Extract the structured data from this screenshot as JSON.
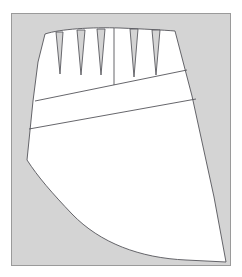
{
  "figure": {
    "title": "Skirt pattern draft with waist darts and yoke lines",
    "kind": "technical-line-drawing",
    "panel": {
      "name": "drawing-panel",
      "background_color": "#d4d4d4",
      "border_color": "#9a9a9a",
      "x": 11,
      "y": 13,
      "width": 220,
      "height": 253
    },
    "canvas": {
      "width": 242,
      "height": 277,
      "background_color": "#ffffff"
    },
    "style": {
      "piece_fill": "#ffffff",
      "line_color": "#55555a",
      "line_width": 0.9,
      "dart_line_color": "#5a5a60"
    },
    "outline": {
      "name": "pattern-piece-outline",
      "description": "Closed skirt panel: curved waistline on top, slanted side seams, angled left hip point, sweeping concave hem",
      "path": "M 45,34 C 60,29 92,27 120,28 C 144,29 163,30 175,31 L 192,96 L 214,197 L 226,262 L 186,260 C 140,258 100,243 72,214 C 52,193 38,177 27,160 L 33,101 L 38,62 Z"
    },
    "darts": [
      {
        "name": "dart-1",
        "left_x": 56,
        "right_x": 63,
        "top_y": 32,
        "tip_x": 60,
        "tip_y": 74
      },
      {
        "name": "dart-2",
        "left_x": 77,
        "right_x": 85,
        "top_y": 30,
        "tip_x": 81,
        "tip_y": 75
      },
      {
        "name": "dart-3",
        "left_x": 97,
        "right_x": 105,
        "top_y": 29,
        "tip_x": 101,
        "tip_y": 75
      },
      {
        "name": "dart-4",
        "left_x": 130,
        "right_x": 138,
        "top_y": 29,
        "tip_x": 134,
        "tip_y": 77
      },
      {
        "name": "dart-5",
        "left_x": 152,
        "right_x": 160,
        "top_y": 30,
        "tip_x": 156,
        "tip_y": 75
      }
    ],
    "guide_lines": [
      {
        "name": "center-front-line",
        "x1": 114,
        "y1": 28,
        "x2": 114,
        "y2": 85
      },
      {
        "name": "upper-yoke-line",
        "x1": 35,
        "y1": 101,
        "x2": 187,
        "y2": 70
      },
      {
        "name": "lower-yoke-line",
        "x1": 29,
        "y1": 129,
        "x2": 196,
        "y2": 99
      }
    ]
  }
}
